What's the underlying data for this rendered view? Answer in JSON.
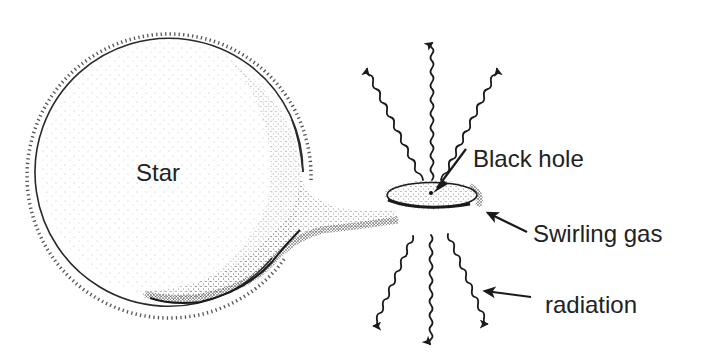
{
  "diagram": {
    "labels": {
      "star": "Star",
      "black_hole": "Black hole",
      "swirling_gas": "Swirling gas",
      "radiation": "radiation"
    },
    "colors": {
      "background": "#ffffff",
      "ink": "#1a1a1a",
      "text": "#222222",
      "stipple": "#333333"
    },
    "geometry": {
      "star": {
        "cx": 173,
        "cy": 167,
        "r": 134
      },
      "accretion_disk": {
        "cx": 432,
        "cy": 195,
        "rx": 47,
        "ry": 14
      },
      "black_hole_point": {
        "x": 431,
        "y": 193
      },
      "radiation_arrows_up": [
        {
          "from": [
            423,
            180
          ],
          "to": [
            378,
            62
          ]
        },
        {
          "from": [
            432,
            180
          ],
          "to": [
            432,
            42
          ]
        },
        {
          "from": [
            441,
            180
          ],
          "to": [
            491,
            61
          ]
        }
      ],
      "radiation_arrows_down": [
        {
          "from": [
            413,
            236
          ],
          "to": [
            372,
            331
          ]
        },
        {
          "from": [
            431,
            235
          ],
          "to": [
            430,
            343
          ]
        },
        {
          "from": [
            448,
            234
          ],
          "to": [
            485,
            328
          ]
        }
      ]
    }
  }
}
